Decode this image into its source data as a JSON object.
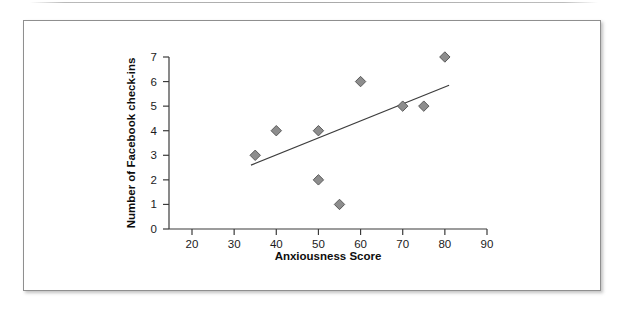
{
  "chart_data": {
    "type": "scatter",
    "title": "",
    "xlabel": "Anxiousness Score",
    "ylabel": "Number of Facebook check-ins",
    "xlim": [
      20,
      90
    ],
    "ylim": [
      0,
      7
    ],
    "xticks": [
      20,
      30,
      40,
      50,
      60,
      70,
      80,
      90
    ],
    "yticks": [
      0,
      1,
      2,
      3,
      4,
      5,
      6,
      7
    ],
    "grid": false,
    "legend": "none",
    "marker_shape": "diamond",
    "marker_color": "#8d8d8d",
    "marker_edge_color": "#5a5a5a",
    "points": [
      {
        "x": 35,
        "y": 3
      },
      {
        "x": 40,
        "y": 4
      },
      {
        "x": 50,
        "y": 4
      },
      {
        "x": 50,
        "y": 2
      },
      {
        "x": 55,
        "y": 1
      },
      {
        "x": 60,
        "y": 6
      },
      {
        "x": 70,
        "y": 5
      },
      {
        "x": 75,
        "y": 5
      },
      {
        "x": 80,
        "y": 7
      }
    ],
    "trendline": {
      "type": "linear",
      "color": "#3d3d3d",
      "x_start": 34,
      "y_start": 2.6,
      "x_end": 81,
      "y_end": 5.85
    }
  },
  "axis": {
    "x_tick_labels": [
      "20",
      "30",
      "40",
      "50",
      "60",
      "70",
      "80",
      "90"
    ],
    "y_tick_labels": [
      "0",
      "1",
      "2",
      "3",
      "4",
      "5",
      "6",
      "7"
    ],
    "x_title": "Anxiousness Score",
    "y_title": "Number of Facebook check-ins"
  }
}
